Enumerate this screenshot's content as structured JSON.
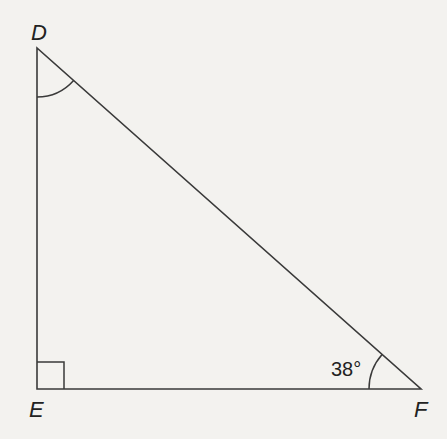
{
  "figure": {
    "type": "geometry-diagram",
    "background_color": "#f3f2ef",
    "line_color": "#3a3a3a",
    "vertices": {
      "d": {
        "label": "D",
        "x": 37,
        "y": 48
      },
      "e": {
        "label": "E",
        "x": 37,
        "y": 389
      },
      "f": {
        "label": "F",
        "x": 421,
        "y": 389
      }
    },
    "angles": {
      "d": {
        "marker": "arc",
        "value": ""
      },
      "e": {
        "marker": "right-angle-square",
        "value": ""
      },
      "f": {
        "marker": "arc",
        "value": "38°"
      }
    }
  }
}
